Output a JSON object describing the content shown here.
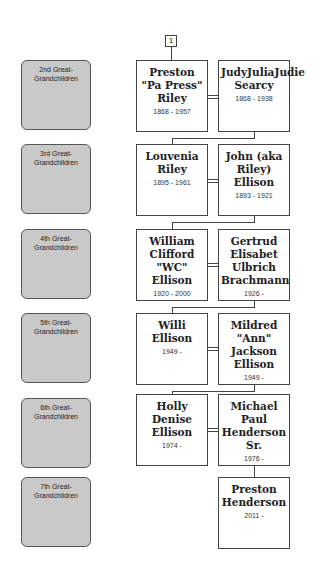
{
  "tree_number": "1",
  "generations": [
    {
      "label": "2nd Great-Grandchildren",
      "left": {
        "name": "Preston \"Pa Press\" Riley",
        "dates": "1868 - 1957"
      },
      "right": {
        "name": "JudyJuliaJudie Searcy",
        "dates": "1868 - 1938"
      }
    },
    {
      "label": "3rd Great-Grandchildren",
      "left": {
        "name": "Louvenia Riley",
        "dates": "1895 - 1961"
      },
      "right": {
        "name": "John (aka Riley) Ellison",
        "dates": "1893 - 1921"
      }
    },
    {
      "label": "4th Great-Grandchildren",
      "left": {
        "name": "William Clifford \"WC\" Ellison",
        "dates": "1920 - 2000"
      },
      "right": {
        "name": "Gertrud Elisabet Ulbrich Brachmann",
        "dates": "1926 -"
      }
    },
    {
      "label": "5th Great-Grandchildren",
      "left": {
        "name": "Willi Ellison",
        "dates": "1949 -"
      },
      "right": {
        "name": "Mildred \"Ann\" Jackson Ellison",
        "dates": "1949 -"
      }
    },
    {
      "label": "6th Great-Grandchildren",
      "left": {
        "name": "Holly Denise Ellison",
        "dates": "1974 -"
      },
      "right": {
        "name": "Michael Paul Henderson Sr.",
        "dates": "1976 -"
      }
    },
    {
      "label": "7th Great-Grandchildren",
      "left": null,
      "right": {
        "name": "Preston Henderson",
        "dates": "2011 -"
      }
    }
  ]
}
